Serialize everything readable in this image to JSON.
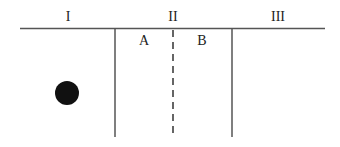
{
  "diagram": {
    "regions": [
      {
        "label": "I"
      },
      {
        "label": "II"
      },
      {
        "label": "III"
      }
    ],
    "subregions": [
      {
        "label": "A"
      },
      {
        "label": "B"
      }
    ],
    "object": {
      "shape": "circle",
      "color": "#111111"
    },
    "colors": {
      "line": "#555555",
      "text": "#222222"
    }
  }
}
